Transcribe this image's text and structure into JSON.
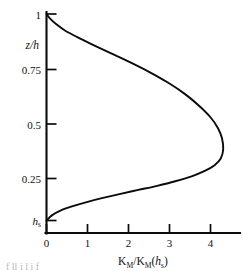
{
  "figure": {
    "name": "eddy-viscosity-vertical-profile",
    "background_color": "#ffffff",
    "ink_color": "#0b0b0b"
  },
  "axes": {
    "y_axis": {
      "title_main": "z",
      "title_sep": "/",
      "title_sub": "h",
      "title_full": "z/h",
      "tick_labels": [
        "1",
        "0.75",
        "0.5",
        "0.25"
      ],
      "bottom_tick_main": "h",
      "bottom_tick_sub": "s",
      "bottom_tick_full": "hs",
      "range": [
        0.0,
        1.0
      ]
    },
    "x_axis": {
      "title_k1": "K",
      "title_k1_sub": "M",
      "title_slash": "/",
      "title_k2": "K",
      "title_k2_sub": "M",
      "title_paren_open": "(",
      "title_h": "h",
      "title_h_sub": "s",
      "title_paren_close": ")",
      "title_full": "KM/KM(hs)",
      "tick_labels": [
        "0",
        "1",
        "2",
        "3",
        "4"
      ],
      "range": [
        0.0,
        4.65
      ]
    }
  },
  "caption_remnant": "f    ll      i  l        i   f",
  "chart_data": {
    "type": "line",
    "title": "",
    "subtitle": "",
    "xlabel": "KM/KM(hs)",
    "ylabel": "z/h",
    "xlim": [
      0.0,
      4.65
    ],
    "ylim": [
      0.0,
      1.0
    ],
    "xticks": [
      0,
      1,
      2,
      3,
      4
    ],
    "xticklabels": [
      "0",
      "1",
      "2",
      "3",
      "4"
    ],
    "yticks": [
      0.0,
      0.25,
      0.5,
      0.75,
      1.0
    ],
    "yticklabels": [
      "hs",
      "0.25",
      "0.5",
      "0.75",
      "1"
    ],
    "grid": false,
    "legend": null,
    "annotations": [],
    "series": [
      {
        "name": "KM/KM(hs)",
        "color": "#0b0b0b",
        "x": [
          0.0,
          0.1,
          0.24,
          0.45,
          0.75,
          1.12,
          1.55,
          2.02,
          2.5,
          2.96,
          3.38,
          3.72,
          4.0,
          4.18,
          4.28,
          4.31,
          4.25,
          4.1,
          3.86,
          3.54,
          3.14,
          2.7,
          2.24,
          1.78,
          1.35,
          0.96,
          0.62,
          0.34,
          0.14,
          0.0
        ],
        "y": [
          1.0,
          0.975,
          0.95,
          0.92,
          0.888,
          0.852,
          0.812,
          0.768,
          0.72,
          0.668,
          0.612,
          0.556,
          0.5,
          0.448,
          0.398,
          0.345,
          0.3,
          0.268,
          0.24,
          0.214,
          0.19,
          0.168,
          0.148,
          0.128,
          0.108,
          0.088,
          0.068,
          0.048,
          0.026,
          0.0
        ]
      }
    ],
    "peak": {
      "x": 4.31,
      "y": 0.32
    }
  }
}
